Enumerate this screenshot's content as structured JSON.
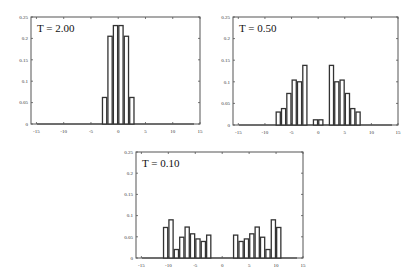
{
  "chart_data": [
    {
      "type": "bar",
      "title": "T = 2.00",
      "xlabel": "",
      "ylabel": "",
      "xlim": [
        -16,
        15
      ],
      "ylim": [
        0,
        0.25
      ],
      "xticks": [
        -15,
        -10,
        -5,
        0,
        5,
        10,
        15
      ],
      "xtick_labels": [
        "-15",
        "-10",
        "-5",
        "0",
        "5",
        "10",
        "15"
      ],
      "yticks": [
        0,
        0.05,
        0.1,
        0.15,
        0.2,
        0.25
      ],
      "ytick_labels": [
        "0",
        "0.05",
        "0.1",
        "0.15",
        "0.2",
        "0.25"
      ],
      "grid": false,
      "x": [
        -3,
        -2,
        -1,
        0,
        1,
        2
      ],
      "values": [
        0.062,
        0.205,
        0.23,
        0.23,
        0.205,
        0.062
      ]
    },
    {
      "type": "bar",
      "title": "T = 0.50",
      "xlabel": "",
      "ylabel": "",
      "xlim": [
        -16,
        15
      ],
      "ylim": [
        0,
        0.25
      ],
      "xticks": [
        -15,
        -10,
        -5,
        0,
        5,
        10,
        15
      ],
      "xtick_labels": [
        "-15",
        "-10",
        "-5",
        "0",
        "5",
        "10",
        "15"
      ],
      "yticks": [
        0,
        0.05,
        0.1,
        0.15,
        0.2,
        0.25
      ],
      "ytick_labels": [
        "0",
        "0.05",
        "0.1",
        "0.15",
        "0.2",
        "0.25"
      ],
      "grid": false,
      "x": [
        -8,
        -7,
        -6,
        -5,
        -4,
        -3,
        -1,
        0,
        2,
        3,
        4,
        5,
        6,
        7
      ],
      "values": [
        0.03,
        0.038,
        0.073,
        0.104,
        0.1,
        0.138,
        0.012,
        0.012,
        0.138,
        0.1,
        0.104,
        0.073,
        0.038,
        0.03
      ]
    },
    {
      "type": "bar",
      "title": "T = 0.10",
      "xlabel": "",
      "ylabel": "",
      "xlim": [
        -16,
        15
      ],
      "ylim": [
        0,
        0.25
      ],
      "xticks": [
        -15,
        -10,
        -5,
        0,
        5,
        10,
        15
      ],
      "xtick_labels": [
        "-15",
        "-10",
        "-5",
        "0",
        "5",
        "10",
        "15"
      ],
      "yticks": [
        0,
        0.05,
        0.1,
        0.15,
        0.2,
        0.25
      ],
      "ytick_labels": [
        "0",
        "0.05",
        "0.1",
        "0.15",
        "0.2",
        "0.25"
      ],
      "grid": false,
      "x": [
        -11,
        -10,
        -9,
        -8,
        -7,
        -6,
        -5,
        -4,
        -3,
        2,
        3,
        4,
        5,
        6,
        7,
        8,
        9,
        10
      ],
      "values": [
        0.072,
        0.09,
        0.02,
        0.049,
        0.073,
        0.057,
        0.045,
        0.039,
        0.054,
        0.054,
        0.039,
        0.045,
        0.057,
        0.073,
        0.049,
        0.02,
        0.09,
        0.072
      ]
    }
  ]
}
